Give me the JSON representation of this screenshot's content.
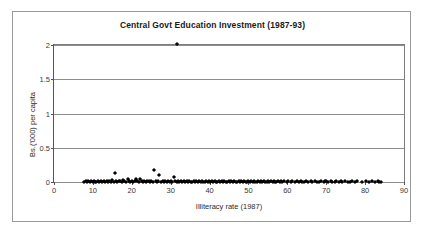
{
  "chart_data": {
    "type": "scatter",
    "title": "Central Govt Education Investment (1987-93)",
    "xlabel": "Illiteracy rate (1987)",
    "ylabel": "Bs.('000) per capita",
    "xlim": [
      0,
      90
    ],
    "ylim": [
      0,
      2
    ],
    "xticks": [
      0,
      10,
      20,
      30,
      40,
      50,
      60,
      70,
      80,
      90
    ],
    "yticks": [
      0,
      0.5,
      1,
      1.5,
      2
    ],
    "xtick_labels": [
      "0",
      "10",
      "20",
      "30",
      "40",
      "50",
      "60",
      "70",
      "80",
      "90"
    ],
    "ytick_labels": [
      "0",
      "0.5",
      "1",
      "1.5",
      "2"
    ],
    "grid": "horizontal",
    "legend": "none",
    "marker": "diamond",
    "marker_color": "#000000",
    "series": [
      {
        "name": "Municipalities",
        "points": [
          [
            7.6,
            0.005
          ],
          [
            8.1,
            0.008
          ],
          [
            8.4,
            0.004
          ],
          [
            8.8,
            0.012
          ],
          [
            9.2,
            0.006
          ],
          [
            9.6,
            0.009
          ],
          [
            9.9,
            0.004
          ],
          [
            10.3,
            0.014
          ],
          [
            10.6,
            0.007
          ],
          [
            10.9,
            0.005
          ],
          [
            11.3,
            0.018
          ],
          [
            11.6,
            0.006
          ],
          [
            12.0,
            0.01
          ],
          [
            12.4,
            0.005
          ],
          [
            12.8,
            0.008
          ],
          [
            13.1,
            0.004
          ],
          [
            13.5,
            0.012
          ],
          [
            13.9,
            0.006
          ],
          [
            14.2,
            0.009
          ],
          [
            14.6,
            0.005
          ],
          [
            15.0,
            0.022
          ],
          [
            15.3,
            0.007
          ],
          [
            15.6,
            0.125
          ],
          [
            15.9,
            0.01
          ],
          [
            16.3,
            0.005
          ],
          [
            16.7,
            0.014
          ],
          [
            17.0,
            0.008
          ],
          [
            17.4,
            0.006
          ],
          [
            17.8,
            0.03
          ],
          [
            18.1,
            0.011
          ],
          [
            18.5,
            0.005
          ],
          [
            18.9,
            0.042
          ],
          [
            19.2,
            0.009
          ],
          [
            19.6,
            0.007
          ],
          [
            20.0,
            0.015
          ],
          [
            20.3,
            0.006
          ],
          [
            20.7,
            0.01
          ],
          [
            21.0,
            0.038
          ],
          [
            21.4,
            0.008
          ],
          [
            21.8,
            0.005
          ],
          [
            22.1,
            0.048
          ],
          [
            22.5,
            0.012
          ],
          [
            22.8,
            0.007
          ],
          [
            23.2,
            0.009
          ],
          [
            23.6,
            0.005
          ],
          [
            23.9,
            0.016
          ],
          [
            24.3,
            0.008
          ],
          [
            24.6,
            0.006
          ],
          [
            25.0,
            0.011
          ],
          [
            25.4,
            0.007
          ],
          [
            25.7,
            0.168
          ],
          [
            26.1,
            0.013
          ],
          [
            26.4,
            0.005
          ],
          [
            26.8,
            0.009
          ],
          [
            27.1,
            0.098
          ],
          [
            27.5,
            0.007
          ],
          [
            27.9,
            0.011
          ],
          [
            28.2,
            0.006
          ],
          [
            28.6,
            0.008
          ],
          [
            29.0,
            0.005
          ],
          [
            29.3,
            0.012
          ],
          [
            29.7,
            0.007
          ],
          [
            30.0,
            0.01
          ],
          [
            30.4,
            0.006
          ],
          [
            30.8,
            0.066
          ],
          [
            31.1,
            0.008
          ],
          [
            31.5,
            0.005
          ],
          [
            31.6,
            2.02
          ],
          [
            31.9,
            0.013
          ],
          [
            32.2,
            0.007
          ],
          [
            32.6,
            0.009
          ],
          [
            33.0,
            0.005
          ],
          [
            33.3,
            0.011
          ],
          [
            33.7,
            0.006
          ],
          [
            34.1,
            0.008
          ],
          [
            34.4,
            0.004
          ],
          [
            34.8,
            0.01
          ],
          [
            35.1,
            0.007
          ],
          [
            35.5,
            0.005
          ],
          [
            35.9,
            0.009
          ],
          [
            36.2,
            0.006
          ],
          [
            36.6,
            0.012
          ],
          [
            36.9,
            0.004
          ],
          [
            37.3,
            0.008
          ],
          [
            37.7,
            0.006
          ],
          [
            38.0,
            0.01
          ],
          [
            38.4,
            0.005
          ],
          [
            38.8,
            0.007
          ],
          [
            39.1,
            0.009
          ],
          [
            39.5,
            0.004
          ],
          [
            39.8,
            0.011
          ],
          [
            40.2,
            0.006
          ],
          [
            40.6,
            0.008
          ],
          [
            40.9,
            0.005
          ],
          [
            41.3,
            0.009
          ],
          [
            41.7,
            0.007
          ],
          [
            42.0,
            0.004
          ],
          [
            42.4,
            0.012
          ],
          [
            42.7,
            0.006
          ],
          [
            43.1,
            0.008
          ],
          [
            43.5,
            0.005
          ],
          [
            43.8,
            0.01
          ],
          [
            44.2,
            0.007
          ],
          [
            44.6,
            0.004
          ],
          [
            44.9,
            0.009
          ],
          [
            45.3,
            0.006
          ],
          [
            45.6,
            0.011
          ],
          [
            46.0,
            0.005
          ],
          [
            46.4,
            0.008
          ],
          [
            46.7,
            0.007
          ],
          [
            47.1,
            0.004
          ],
          [
            47.5,
            0.01
          ],
          [
            47.8,
            0.006
          ],
          [
            48.2,
            0.008
          ],
          [
            48.5,
            0.005
          ],
          [
            48.9,
            0.009
          ],
          [
            49.3,
            0.007
          ],
          [
            49.6,
            0.004
          ],
          [
            50.0,
            0.011
          ],
          [
            50.4,
            0.006
          ],
          [
            50.7,
            0.008
          ],
          [
            51.1,
            0.005
          ],
          [
            51.4,
            0.01
          ],
          [
            51.8,
            0.007
          ],
          [
            52.2,
            0.004
          ],
          [
            52.5,
            0.009
          ],
          [
            52.9,
            0.006
          ],
          [
            53.3,
            0.008
          ],
          [
            53.6,
            0.005
          ],
          [
            54.0,
            0.01
          ],
          [
            54.3,
            0.007
          ],
          [
            54.7,
            0.004
          ],
          [
            55.1,
            0.009
          ],
          [
            55.4,
            0.006
          ],
          [
            55.8,
            0.008
          ],
          [
            56.2,
            0.005
          ],
          [
            56.5,
            0.011
          ],
          [
            56.9,
            0.007
          ],
          [
            57.2,
            0.004
          ],
          [
            57.6,
            0.009
          ],
          [
            58.0,
            0.006
          ],
          [
            58.3,
            0.008
          ],
          [
            58.7,
            0.005
          ],
          [
            59.1,
            0.01
          ],
          [
            59.8,
            0.007
          ],
          [
            60.2,
            0.012
          ],
          [
            60.9,
            0.005
          ],
          [
            61.3,
            0.008
          ],
          [
            62.0,
            0.006
          ],
          [
            62.4,
            0.009
          ],
          [
            63.1,
            0.005
          ],
          [
            63.5,
            0.011
          ],
          [
            63.8,
            0.007
          ],
          [
            64.2,
            0.004
          ],
          [
            64.9,
            0.009
          ],
          [
            65.3,
            0.006
          ],
          [
            66.0,
            0.008
          ],
          [
            66.4,
            0.005
          ],
          [
            67.1,
            0.01
          ],
          [
            67.5,
            0.007
          ],
          [
            68.2,
            0.004
          ],
          [
            68.6,
            0.009
          ],
          [
            69.3,
            0.006
          ],
          [
            69.7,
            0.012
          ],
          [
            70.0,
            0.008
          ],
          [
            70.4,
            0.005
          ],
          [
            71.1,
            0.009
          ],
          [
            71.5,
            0.007
          ],
          [
            72.2,
            0.004
          ],
          [
            72.6,
            0.01
          ],
          [
            73.3,
            0.006
          ],
          [
            73.7,
            0.008
          ],
          [
            74.0,
            0.005
          ],
          [
            74.8,
            0.009
          ],
          [
            75.5,
            0.007
          ],
          [
            76.2,
            0.004
          ],
          [
            76.6,
            0.011
          ],
          [
            77.3,
            0.006
          ],
          [
            78.0,
            0.008
          ],
          [
            79.1,
            0.005
          ],
          [
            80.2,
            0.009
          ],
          [
            81.0,
            0.006
          ],
          [
            81.8,
            0.008
          ],
          [
            82.5,
            0.005
          ],
          [
            83.2,
            0.01
          ],
          [
            83.6,
            0.007
          ],
          [
            84.0,
            0.006
          ]
        ]
      }
    ]
  }
}
